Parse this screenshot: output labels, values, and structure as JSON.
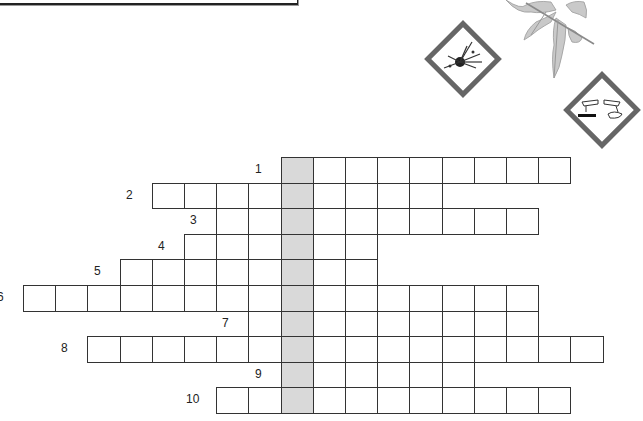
{
  "puzzle": {
    "type": "crossword",
    "grid": {
      "origin_x": 23,
      "origin_y": 157,
      "cell_w": 32.2,
      "cell_h": 25.6,
      "highlight_col": 8,
      "highlight_color": "#d9d9d9",
      "rows": [
        {
          "number": "1",
          "start": 8,
          "end": 17
        },
        {
          "number": "2",
          "start": 4,
          "end": 13
        },
        {
          "number": "3",
          "start": 6,
          "end": 16
        },
        {
          "number": "4",
          "start": 5,
          "end": 11
        },
        {
          "number": "5",
          "start": 3,
          "end": 11
        },
        {
          "number": "6",
          "start": 0,
          "end": 16
        },
        {
          "number": "7",
          "start": 7,
          "end": 16
        },
        {
          "number": "8",
          "start": 2,
          "end": 18
        },
        {
          "number": "9",
          "start": 8,
          "end": 14
        },
        {
          "number": "10",
          "start": 6,
          "end": 17
        }
      ]
    }
  },
  "decorations": {
    "icons": [
      "explosive-hazard-icon",
      "corrosive-hazard-icon",
      "tomato-leaf-illustration"
    ]
  }
}
